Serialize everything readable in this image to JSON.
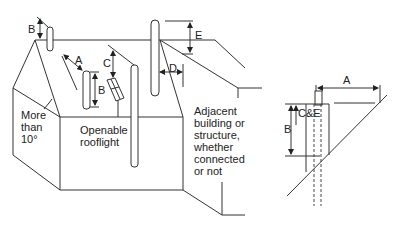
{
  "diagram": {
    "left_figure": {
      "labels": {
        "roof_pitch": [
          "More",
          "than",
          "10°"
        ],
        "rooflight": [
          "Openable",
          "rooflight"
        ],
        "adjacent": [
          "Adjacent",
          "building or",
          "structure,",
          "whether",
          "connected",
          "or not"
        ]
      },
      "dimensions": {
        "b_top": "B",
        "a_slope": "A",
        "b_flue": "B",
        "c_rooflight": "C",
        "d_adjacent": "D",
        "e_adjacent": "E"
      }
    },
    "right_figure": {
      "dimensions": {
        "a": "A",
        "b": "B",
        "ce": "C&E"
      }
    },
    "colors": {
      "line": "#333333",
      "background": "#ffffff"
    }
  }
}
